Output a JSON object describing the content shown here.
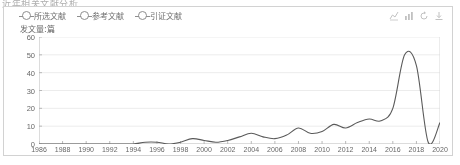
{
  "page_title": "近年相关文献分析",
  "legend": {
    "items": [
      {
        "label": "所选文献",
        "name": "legend-selected-literature"
      },
      {
        "label": "参考文献",
        "name": "legend-reference-literature"
      },
      {
        "label": "引证文献",
        "name": "legend-citing-literature"
      }
    ]
  },
  "toolbar": {
    "icons": [
      {
        "name": "line-chart-icon",
        "title": "折线图"
      },
      {
        "name": "bar-chart-icon",
        "title": "柱状图"
      },
      {
        "name": "refresh-icon",
        "title": "刷新"
      },
      {
        "name": "download-icon",
        "title": "下载"
      }
    ]
  },
  "chart_data": {
    "type": "line",
    "title": "",
    "xlabel": "",
    "ylabel": "发文量:篇",
    "ylim": [
      0,
      60
    ],
    "xlim": [
      1986,
      2020
    ],
    "grid": true,
    "legend_position": "top-left",
    "yticks": [
      0,
      10,
      20,
      30,
      40,
      50,
      60
    ],
    "xticks": [
      1986,
      1988,
      1990,
      1992,
      1994,
      1996,
      1998,
      2000,
      2002,
      2004,
      2006,
      2008,
      2010,
      2012,
      2014,
      2016,
      2018,
      2020
    ],
    "x": [
      1986,
      1987,
      1988,
      1989,
      1990,
      1991,
      1992,
      1993,
      1994,
      1995,
      1996,
      1997,
      1998,
      1999,
      2000,
      2001,
      2002,
      2003,
      2004,
      2005,
      2006,
      2007,
      2008,
      2009,
      2010,
      2011,
      2012,
      2013,
      2014,
      2015,
      2016,
      2017,
      2018,
      2019,
      2020
    ],
    "series": [
      {
        "name": "所选文献",
        "values": [
          0,
          0,
          0,
          0,
          0,
          0,
          0,
          0,
          0,
          1,
          1,
          0,
          1,
          3,
          2,
          1,
          2,
          4,
          6,
          4,
          3,
          5,
          9,
          6,
          7,
          11,
          9,
          12,
          14,
          13,
          20,
          50,
          44,
          1,
          12
        ]
      }
    ]
  }
}
